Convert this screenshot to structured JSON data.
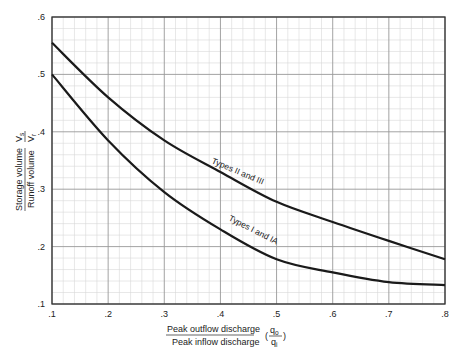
{
  "chart_data": {
    "type": "line",
    "title": "",
    "xlabel": "Peak outflow discharge / Peak inflow discharge (qo/qi)",
    "xlabel_numerator": "Peak outflow discharge",
    "xlabel_denominator": "Peak inflow discharge",
    "xlabel_symbol_num": "q",
    "xlabel_symbol_num_sub": "o",
    "xlabel_symbol_den": "q",
    "xlabel_symbol_den_sub": "i",
    "ylabel": "Storage volume / Runoff volume (Vs/Vr)",
    "ylabel_numerator": "Storage volume",
    "ylabel_denominator": "Runoff volume",
    "ylabel_symbol_num": "V",
    "ylabel_symbol_num_sub": "s",
    "ylabel_symbol_den": "V",
    "ylabel_symbol_den_sub": "r",
    "xlim": [
      0.1,
      0.8
    ],
    "ylim": [
      0.1,
      0.6
    ],
    "x_ticks": [
      ".1",
      ".2",
      ".3",
      ".4",
      ".5",
      ".6",
      ".7",
      ".8"
    ],
    "y_ticks": [
      ".1",
      ".2",
      ".3",
      ".4",
      ".5",
      ".6"
    ],
    "grid": true,
    "minor_grid": true,
    "legend": "none (curves labeled inline)",
    "x": [
      0.1,
      0.2,
      0.3,
      0.4,
      0.5,
      0.6,
      0.7,
      0.8
    ],
    "series": [
      {
        "name": "Types II and III",
        "values": [
          0.555,
          0.46,
          0.385,
          0.33,
          0.278,
          0.243,
          0.21,
          0.178
        ]
      },
      {
        "name": "Types I and IA",
        "values": [
          0.5,
          0.385,
          0.295,
          0.23,
          0.178,
          0.155,
          0.138,
          0.133
        ]
      }
    ]
  },
  "colors": {
    "curve": "#1a1a1a",
    "axis": "#333333",
    "major_grid": "#999999",
    "minor_grid": "#d8d8d8"
  }
}
